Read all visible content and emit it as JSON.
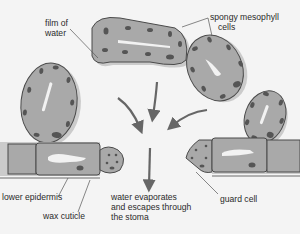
{
  "diagram": {
    "labels": {
      "film_of_water": [
        "film of",
        "water"
      ],
      "spongy_mesophyll": [
        "spongy mesophyll",
        "cells"
      ],
      "lower_epidermis": "lower epidermis",
      "wax_cuticle": "wax cuticle",
      "water_evaporates": [
        "water evaporates",
        "and escapes through",
        "the stoma"
      ],
      "guard_cell": "guard cell"
    },
    "colors": {
      "background": "#f4f4f4",
      "cell_fill": "#a9a9a9",
      "cell_outline": "#4a4a4a",
      "water_film": "#c9c9c9",
      "organelle": "#555555",
      "vacuole": "#f2f2f2",
      "arrow": "#666666",
      "leader_line": "#555555"
    }
  }
}
